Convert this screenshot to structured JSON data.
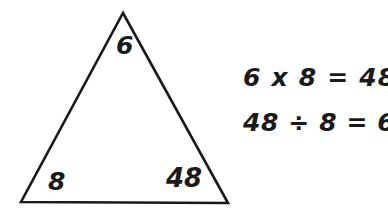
{
  "diagram": {
    "type": "fact-family-triangle",
    "shape": "triangle",
    "stroke_color": "#1a1a1a",
    "background_color": "#ffffff",
    "vertices": [
      {
        "position": "top",
        "label": "6"
      },
      {
        "position": "bottom-left",
        "label": "8"
      },
      {
        "position": "bottom-right",
        "label": "48"
      }
    ]
  },
  "equations": [
    {
      "id": "multiplication",
      "text": "6 x 8 = 48"
    },
    {
      "id": "division",
      "text": "48 ÷ 8 = 6"
    }
  ]
}
